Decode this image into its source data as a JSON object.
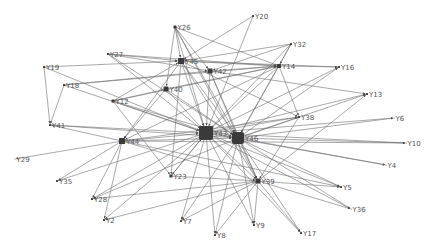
{
  "diagram": {
    "type": "directed-network",
    "colors": {
      "edge": "#6f6f6f",
      "node": "#3a3a3a",
      "label": "#555555",
      "background": "#ffffff"
    },
    "nodes": [
      {
        "id": "Y26",
        "x": 175,
        "y": 27,
        "size": 3
      },
      {
        "id": "Y20",
        "x": 253,
        "y": 16,
        "size": 2
      },
      {
        "id": "Y32",
        "x": 291,
        "y": 44,
        "size": 2
      },
      {
        "id": "Y27",
        "x": 108,
        "y": 54,
        "size": 2
      },
      {
        "id": "Y45",
        "x": 181,
        "y": 61,
        "size": 6
      },
      {
        "id": "Y42",
        "x": 210,
        "y": 71,
        "size": 5
      },
      {
        "id": "Y14",
        "x": 279,
        "y": 66,
        "size": 4
      },
      {
        "id": "Y16",
        "x": 339,
        "y": 67,
        "size": 2
      },
      {
        "id": "Y19",
        "x": 44,
        "y": 67,
        "size": 2
      },
      {
        "id": "Y18",
        "x": 64,
        "y": 85,
        "size": 2
      },
      {
        "id": "Y40",
        "x": 166,
        "y": 89,
        "size": 5
      },
      {
        "id": "Y12",
        "x": 113,
        "y": 101,
        "size": 3
      },
      {
        "id": "Y13",
        "x": 367,
        "y": 94,
        "size": 2
      },
      {
        "id": "Y38",
        "x": 299,
        "y": 117,
        "size": 2
      },
      {
        "id": "Y6",
        "x": 394,
        "y": 118,
        "size": 1
      },
      {
        "id": "Y41",
        "x": 50,
        "y": 125,
        "size": 2
      },
      {
        "id": "Y44",
        "x": 122,
        "y": 141,
        "size": 6
      },
      {
        "id": "Y43",
        "x": 206,
        "y": 133,
        "size": 14
      },
      {
        "id": "Y46",
        "x": 238,
        "y": 138,
        "size": 12
      },
      {
        "id": "Y10",
        "x": 406,
        "y": 143,
        "size": 1
      },
      {
        "id": "Y29",
        "x": 15,
        "y": 159,
        "size": 1
      },
      {
        "id": "Y4",
        "x": 386,
        "y": 165,
        "size": 1
      },
      {
        "id": "Y23",
        "x": 171,
        "y": 176,
        "size": 3
      },
      {
        "id": "Y39",
        "x": 258,
        "y": 181,
        "size": 5
      },
      {
        "id": "Y5",
        "x": 341,
        "y": 187,
        "size": 2
      },
      {
        "id": "Y35",
        "x": 57,
        "y": 181,
        "size": 2
      },
      {
        "id": "Y28",
        "x": 92,
        "y": 199,
        "size": 2
      },
      {
        "id": "Y36",
        "x": 351,
        "y": 209,
        "size": 1
      },
      {
        "id": "Y2",
        "x": 104,
        "y": 220,
        "size": 2
      },
      {
        "id": "Y7",
        "x": 181,
        "y": 221,
        "size": 2
      },
      {
        "id": "Y9",
        "x": 254,
        "y": 225,
        "size": 2
      },
      {
        "id": "Y8",
        "x": 215,
        "y": 235,
        "size": 2
      },
      {
        "id": "Y17",
        "x": 301,
        "y": 233,
        "size": 2
      }
    ],
    "edges": [
      [
        "Y26",
        "Y45"
      ],
      [
        "Y26",
        "Y42"
      ],
      [
        "Y26",
        "Y43"
      ],
      [
        "Y26",
        "Y46"
      ],
      [
        "Y26",
        "Y40"
      ],
      [
        "Y26",
        "Y39"
      ],
      [
        "Y26",
        "Y14"
      ],
      [
        "Y20",
        "Y45"
      ],
      [
        "Y20",
        "Y43"
      ],
      [
        "Y32",
        "Y45"
      ],
      [
        "Y32",
        "Y42"
      ],
      [
        "Y32",
        "Y43"
      ],
      [
        "Y32",
        "Y46"
      ],
      [
        "Y32",
        "Y14"
      ],
      [
        "Y27",
        "Y45"
      ],
      [
        "Y27",
        "Y42"
      ],
      [
        "Y27",
        "Y43"
      ],
      [
        "Y27",
        "Y46"
      ],
      [
        "Y27",
        "Y14"
      ],
      [
        "Y45",
        "Y14"
      ],
      [
        "Y45",
        "Y16"
      ],
      [
        "Y45",
        "Y43"
      ],
      [
        "Y45",
        "Y46"
      ],
      [
        "Y45",
        "Y44"
      ],
      [
        "Y45",
        "Y38"
      ],
      [
        "Y45",
        "Y39"
      ],
      [
        "Y45",
        "Y23"
      ],
      [
        "Y42",
        "Y14"
      ],
      [
        "Y42",
        "Y43"
      ],
      [
        "Y42",
        "Y46"
      ],
      [
        "Y42",
        "Y13"
      ],
      [
        "Y42",
        "Y39"
      ],
      [
        "Y14",
        "Y16"
      ],
      [
        "Y14",
        "Y38"
      ],
      [
        "Y14",
        "Y43"
      ],
      [
        "Y14",
        "Y46"
      ],
      [
        "Y14",
        "Y44"
      ],
      [
        "Y19",
        "Y45"
      ],
      [
        "Y19",
        "Y41"
      ],
      [
        "Y19",
        "Y43"
      ],
      [
        "Y18",
        "Y41"
      ],
      [
        "Y18",
        "Y42"
      ],
      [
        "Y18",
        "Y14"
      ],
      [
        "Y18",
        "Y43"
      ],
      [
        "Y40",
        "Y43"
      ],
      [
        "Y40",
        "Y46"
      ],
      [
        "Y40",
        "Y44"
      ],
      [
        "Y40",
        "Y14"
      ],
      [
        "Y12",
        "Y43"
      ],
      [
        "Y12",
        "Y46"
      ],
      [
        "Y12",
        "Y40"
      ],
      [
        "Y12",
        "Y14"
      ],
      [
        "Y12",
        "Y23"
      ],
      [
        "Y12",
        "Y45"
      ],
      [
        "Y43",
        "Y13"
      ],
      [
        "Y43",
        "Y16"
      ],
      [
        "Y43",
        "Y38"
      ],
      [
        "Y43",
        "Y6"
      ],
      [
        "Y43",
        "Y10"
      ],
      [
        "Y43",
        "Y4"
      ],
      [
        "Y43",
        "Y5"
      ],
      [
        "Y43",
        "Y36"
      ],
      [
        "Y43",
        "Y39"
      ],
      [
        "Y43",
        "Y7"
      ],
      [
        "Y43",
        "Y8"
      ],
      [
        "Y43",
        "Y9"
      ],
      [
        "Y43",
        "Y17"
      ],
      [
        "Y43",
        "Y2"
      ],
      [
        "Y43",
        "Y28"
      ],
      [
        "Y43",
        "Y35"
      ],
      [
        "Y43",
        "Y23"
      ],
      [
        "Y43",
        "Y46"
      ],
      [
        "Y46",
        "Y13"
      ],
      [
        "Y46",
        "Y16"
      ],
      [
        "Y46",
        "Y38"
      ],
      [
        "Y46",
        "Y6"
      ],
      [
        "Y46",
        "Y10"
      ],
      [
        "Y46",
        "Y4"
      ],
      [
        "Y46",
        "Y5"
      ],
      [
        "Y46",
        "Y36"
      ],
      [
        "Y46",
        "Y39"
      ],
      [
        "Y46",
        "Y7"
      ],
      [
        "Y46",
        "Y8"
      ],
      [
        "Y46",
        "Y9"
      ],
      [
        "Y46",
        "Y17"
      ],
      [
        "Y46",
        "Y28"
      ],
      [
        "Y44",
        "Y43"
      ],
      [
        "Y44",
        "Y46"
      ],
      [
        "Y44",
        "Y41"
      ],
      [
        "Y44",
        "Y29"
      ],
      [
        "Y44",
        "Y35"
      ],
      [
        "Y44",
        "Y28"
      ],
      [
        "Y44",
        "Y2"
      ],
      [
        "Y44",
        "Y10"
      ],
      [
        "Y44",
        "Y5"
      ],
      [
        "Y44",
        "Y39"
      ],
      [
        "Y44",
        "Y38"
      ],
      [
        "Y41",
        "Y43"
      ],
      [
        "Y41",
        "Y46"
      ],
      [
        "Y23",
        "Y39"
      ],
      [
        "Y23",
        "Y43"
      ],
      [
        "Y39",
        "Y7"
      ],
      [
        "Y39",
        "Y8"
      ],
      [
        "Y39",
        "Y9"
      ],
      [
        "Y39",
        "Y17"
      ],
      [
        "Y39",
        "Y5"
      ],
      [
        "Y39",
        "Y36"
      ],
      [
        "Y39",
        "Y2"
      ],
      [
        "Y39",
        "Y28"
      ],
      [
        "Y39",
        "Y13"
      ],
      [
        "Y38",
        "Y39"
      ]
    ]
  }
}
